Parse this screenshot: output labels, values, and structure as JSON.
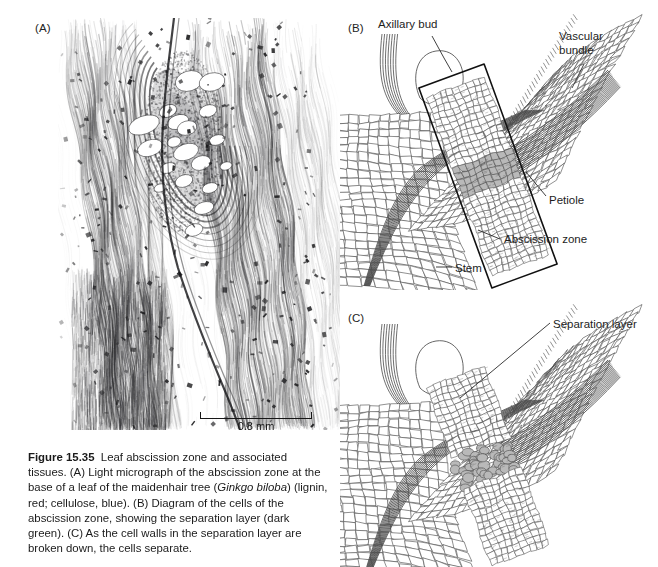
{
  "figure": {
    "number": "Figure 15.35",
    "title": "Leaf abscission zone and associated tissues.",
    "caption_rest": " (A) Light micrograph of the abscission zone at the base of a leaf of the maidenhair tree (",
    "species": "Ginkgo biloba",
    "caption_rest2": ") (lignin, red; cellulose, blue). (B) Diagram of the cells of the abscission zone, showing the separation layer (dark green). (C) As the cell walls in the separation layer are broken down, the cells separate."
  },
  "panels": {
    "a": {
      "label": "(A)",
      "type": "light-micrograph",
      "scalebar": {
        "value": "0.8 mm"
      }
    },
    "b": {
      "label": "(B)",
      "type": "cell-diagram",
      "annotations": [
        {
          "name": "axillary-bud",
          "text": "Axillary bud"
        },
        {
          "name": "vascular-bundle",
          "text": "Vascular bundle"
        },
        {
          "name": "petiole",
          "text": "Petiole"
        },
        {
          "name": "abscission-zone",
          "text": "Abscission zone"
        },
        {
          "name": "stem",
          "text": "Stem"
        }
      ]
    },
    "c": {
      "label": "(C)",
      "type": "cell-diagram",
      "annotations": [
        {
          "name": "separation-layer",
          "text": "Separation layer"
        }
      ]
    }
  },
  "colors": {
    "ink": "#1b1b1b",
    "cell_line": "#4c4c4c",
    "bundle_dark": "#555555",
    "separation_fill": "#b9b9b9",
    "background": "#ffffff"
  }
}
